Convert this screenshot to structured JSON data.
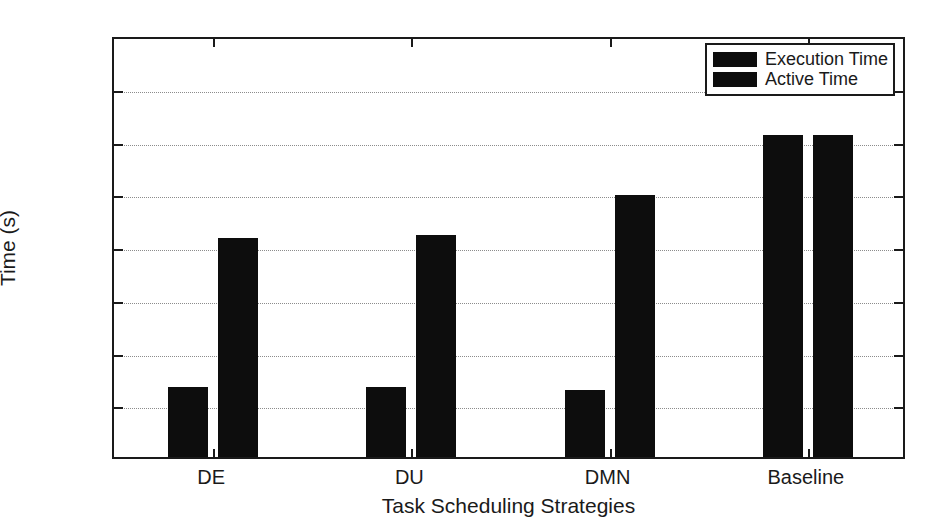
{
  "chart_data": {
    "type": "bar",
    "title": "",
    "xlabel": "Task Scheduling Strategies",
    "ylabel": "Time (s)",
    "categories": [
      "DE",
      "DU",
      "DMN",
      "Baseline"
    ],
    "series": [
      {
        "name": "Execution Time",
        "values": [
          1320,
          1320,
          1270,
          6100
        ],
        "color": "#0d0d0d"
      },
      {
        "name": "Active Time",
        "values": [
          4150,
          4200,
          4970,
          6100
        ],
        "color": "#0d0d0d"
      }
    ],
    "ylim": [
      0,
      8000
    ],
    "yticks": [
      0,
      1000,
      2000,
      3000,
      4000,
      5000,
      6000,
      7000,
      8000
    ],
    "ytick_labels": [
      "0",
      "1000",
      "2000",
      "3000",
      "4000",
      "5000",
      "6000",
      "7000",
      "8000"
    ],
    "grid": true,
    "grid_axis": "y",
    "grid_style": "dotted",
    "legend": {
      "position": "top-right",
      "entries": [
        "Execution Time",
        "Active Time"
      ]
    },
    "frame": "box",
    "background": "#ffffff",
    "axis_color": "#1a1a1a"
  }
}
